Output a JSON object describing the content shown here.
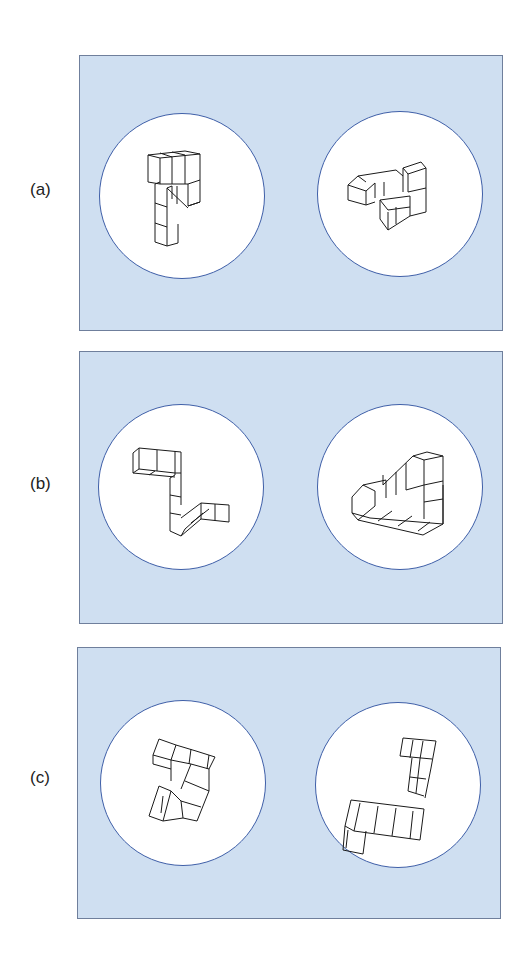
{
  "figure": {
    "type": "mental-rotation-task",
    "rows": [
      {
        "label": "(a)",
        "left_figure": "cube-object-a-left",
        "right_figure": "cube-object-a-right"
      },
      {
        "label": "(b)",
        "left_figure": "cube-object-b-left",
        "right_figure": "cube-object-b-right"
      },
      {
        "label": "(c)",
        "left_figure": "cube-object-c-left",
        "right_figure": "cube-object-c-right"
      }
    ],
    "colors": {
      "panel_background": "#cfdff1",
      "panel_border": "#6f7f9c",
      "circle_fill": "#ffffff",
      "circle_border": "#3f5fa8",
      "line": "#1a1a1a"
    }
  }
}
